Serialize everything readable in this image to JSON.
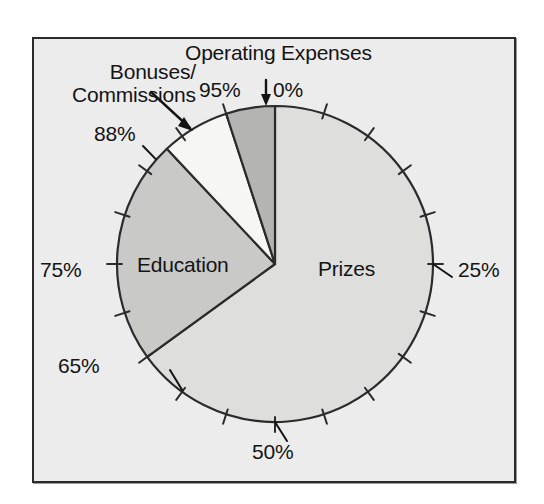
{
  "figure": {
    "background_color": "#ececed",
    "border_color": "#2b2b2b",
    "page_color": "#ffffff"
  },
  "labels": {
    "operating_expenses": "Operating Expenses",
    "bonuses_line1": "Bonuses/",
    "bonuses_line2": "Commissions",
    "education": "Education",
    "prizes": "Prizes"
  },
  "axis_labels": {
    "p0": "0%",
    "p25": "25%",
    "p50": "50%",
    "p65": "65%",
    "p75": "75%",
    "p88": "88%",
    "p95": "95%"
  },
  "chart_data": {
    "type": "pie",
    "title": "",
    "subtitle": "",
    "xlabel": "",
    "ylabel": "",
    "grid": false,
    "legend": "none",
    "units": "percent",
    "total": 100,
    "start_angle_deg": 0,
    "direction": "clockwise",
    "scale_ticks": {
      "interval_percent": 5,
      "count": 20,
      "labeled": [
        0,
        25,
        50,
        65,
        75,
        88,
        95
      ],
      "tick_labels": [
        "0%",
        "25%",
        "50%",
        "65%",
        "75%",
        "88%",
        "95%"
      ]
    },
    "slices": [
      {
        "name": "Prizes",
        "label": "Prizes",
        "start_percent": 0,
        "end_percent": 65,
        "value": 65,
        "color": "#dededd",
        "stroke": "#2b2b2b",
        "label_inside": true
      },
      {
        "name": "Education",
        "label": "Education",
        "start_percent": 65,
        "end_percent": 88,
        "value": 23,
        "color": "#c9c9c8",
        "stroke": "#2b2b2b",
        "label_inside": true
      },
      {
        "name": "Bonuses/Commissions",
        "label": "Bonuses/Commissions",
        "start_percent": 88,
        "end_percent": 95,
        "value": 7,
        "color": "#f6f6f5",
        "stroke": "#2b2b2b",
        "label_inside": false
      },
      {
        "name": "Operating Expenses",
        "label": "Operating Expenses",
        "start_percent": 95,
        "end_percent": 100,
        "value": 5,
        "color": "#b4b4b3",
        "stroke": "#2b2b2b",
        "label_inside": false
      }
    ],
    "categories": [
      "Prizes",
      "Education",
      "Bonuses/Commissions",
      "Operating Expenses"
    ],
    "values": [
      65,
      23,
      7,
      5
    ],
    "cumulative_percent": [
      65,
      88,
      95,
      100
    ]
  }
}
